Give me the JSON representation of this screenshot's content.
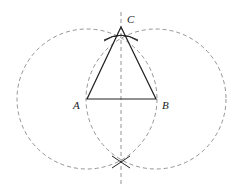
{
  "diagram": {
    "type": "geometric-construction",
    "colors": {
      "solid_line": "#222222",
      "dashed_line": "#888888",
      "label": "#222222",
      "background": "#ffffff"
    },
    "points": {
      "A": {
        "label": "A",
        "x": 87,
        "y": 99
      },
      "B": {
        "label": "B",
        "x": 156,
        "y": 99
      },
      "C": {
        "label": "C",
        "x": 121,
        "y": 27
      }
    },
    "labels": {
      "A": "A",
      "B": "B",
      "C": "C"
    },
    "circles": [
      {
        "center": "A",
        "cx": 87,
        "cy": 99,
        "r": 70,
        "style": "dashed"
      },
      {
        "center": "B",
        "cx": 156,
        "cy": 99,
        "r": 70,
        "style": "dashed"
      }
    ],
    "bisector": {
      "x": 121,
      "y1": 12,
      "y2": 184,
      "style": "dashed"
    },
    "triangle": {
      "vertices": [
        "A",
        "B",
        "C"
      ],
      "style": "solid"
    },
    "intersections": [
      {
        "name": "upper",
        "x": 121,
        "y": 27
      },
      {
        "name": "lower",
        "x": 121,
        "y": 162
      }
    ]
  }
}
